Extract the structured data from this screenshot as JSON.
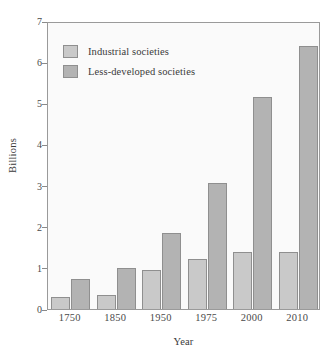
{
  "chart_data": {
    "type": "bar",
    "title": "",
    "subtitle": "",
    "xlabel": "Year",
    "ylabel": "Billions",
    "categories": [
      "1750",
      "1850",
      "1950",
      "1975",
      "2000",
      "2010"
    ],
    "series": [
      {
        "name": "Industrial societies",
        "color": "#c9c9c9",
        "values": [
          0.28,
          0.35,
          0.95,
          1.22,
          1.39,
          1.39
        ]
      },
      {
        "name": "Less-developed societies",
        "color": "#b3b3b3",
        "values": [
          0.72,
          1.0,
          1.85,
          3.07,
          5.15,
          6.4
        ]
      }
    ],
    "ylim": [
      0,
      7
    ],
    "yticks": [
      "0",
      "1",
      "2",
      "3",
      "4",
      "5",
      "6",
      "7"
    ],
    "grid": false,
    "legend_position": "top-left",
    "plot_background": "#fafafa",
    "frame_color": "#9a9a9a"
  }
}
